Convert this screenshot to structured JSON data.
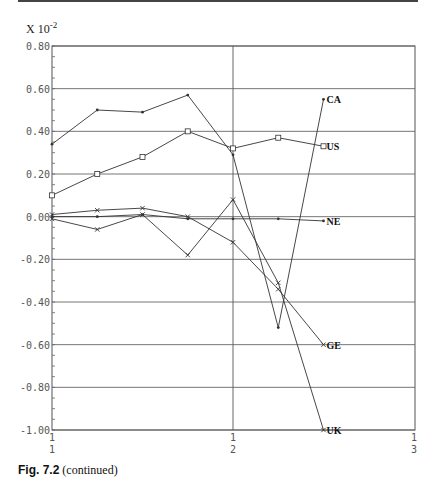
{
  "caption": {
    "bold": "Fig. 7.2",
    "rest": " (continued)"
  },
  "chart_data": {
    "type": "line",
    "title": "",
    "scale_label": "X 10^-2",
    "xlabel": "",
    "ylabel": "",
    "ylim": [
      -1.0,
      0.8
    ],
    "yticks": [
      "0.80",
      "0.60",
      "0.40",
      "0.20",
      "0.00",
      "-0.20",
      "-0.40",
      "-0.60",
      "-0.80",
      "-1.00"
    ],
    "xticks": [
      {
        "top": "1",
        "bottom": "1"
      },
      {
        "top": "1",
        "bottom": "2"
      },
      {
        "top": "1",
        "bottom": "3"
      }
    ],
    "grid": true,
    "x": [
      1,
      2,
      3,
      4,
      5,
      6,
      7
    ],
    "series": [
      {
        "name": "CA",
        "marker": "dot",
        "values": [
          0.34,
          0.5,
          0.49,
          0.57,
          0.29,
          -0.52,
          0.55
        ]
      },
      {
        "name": "US",
        "marker": "square",
        "values": [
          0.1,
          0.2,
          0.28,
          0.4,
          0.32,
          0.37,
          0.33
        ]
      },
      {
        "name": "NE",
        "marker": "dot",
        "values": [
          0.0,
          0.0,
          0.01,
          -0.01,
          -0.01,
          -0.01,
          -0.02
        ]
      },
      {
        "name": "GE",
        "marker": "x",
        "values": [
          0.01,
          0.03,
          0.04,
          0.0,
          -0.12,
          -0.34,
          -0.6
        ]
      },
      {
        "name": "UK",
        "marker": "x",
        "values": [
          -0.01,
          -0.06,
          0.01,
          -0.18,
          0.08,
          -0.31,
          -1.0
        ]
      }
    ]
  }
}
